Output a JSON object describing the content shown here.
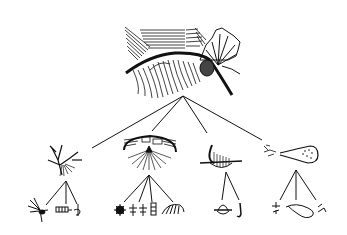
{
  "diagram": {
    "type": "tree",
    "background": "#ffffff",
    "ink": "#111111",
    "root": {
      "name": "root-drawing",
      "description": "large composite drawing: hatched arc with fan/brush forms and branching rosette"
    },
    "level1": [
      {
        "name": "node-1",
        "description": "branching twig with fringe"
      },
      {
        "name": "node-2",
        "description": "hatched arch with radiating strokes"
      },
      {
        "name": "node-3",
        "description": "hatched hook/bowl shape"
      },
      {
        "name": "node-4",
        "description": "spoon/ladle shape with dotted bowl"
      }
    ],
    "level2": [
      {
        "parent": 0,
        "items": [
          "starburst-sprig",
          "hatched-bar",
          "curl-mark"
        ]
      },
      {
        "parent": 1,
        "items": [
          "rosette",
          "twin-sprigs",
          "ladder-mark",
          "fan-mark"
        ]
      },
      {
        "parent": 2,
        "items": [
          "saucer-shape",
          "hook-mark"
        ]
      },
      {
        "parent": 3,
        "items": [
          "small-glyph",
          "loop-shape",
          "small-mark"
        ]
      }
    ]
  }
}
